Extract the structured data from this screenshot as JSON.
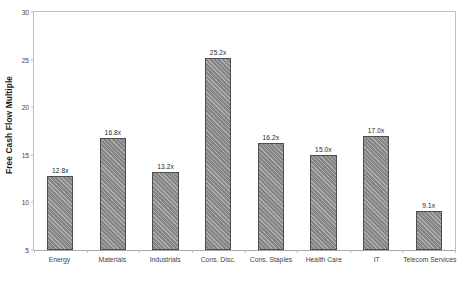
{
  "chart_data": {
    "type": "bar",
    "title": "",
    "xlabel": "",
    "ylabel": "Free Cash Flow Multiple",
    "ylim": [
      5,
      30
    ],
    "yticks": [
      5,
      10,
      15,
      20,
      25,
      30
    ],
    "ytick_labels": [
      "5",
      "10",
      "15",
      "20",
      "25",
      "30"
    ],
    "grid": false,
    "legend": false,
    "label_suffix": "x",
    "categories": [
      "Energy",
      "Materials",
      "Industrials",
      "Cons. Disc.",
      "Cons. Staples",
      "Health Care",
      "IT",
      "Telecom Services"
    ],
    "values": [
      12.8,
      16.8,
      13.2,
      25.2,
      16.2,
      15.0,
      17.0,
      9.1
    ],
    "data_labels": [
      "12.8x",
      "16.8x",
      "13.2x",
      "25.2x",
      "16.2x",
      "15.0x",
      "17.0x",
      "9.1x"
    ],
    "bar_color": "#858585",
    "bar_edge_color": "#4d4d4d",
    "bar_pattern": "diagonal-hatch",
    "frame_color": "#bfbfbf",
    "background_color": "#ffffff"
  },
  "caption": {
    "text": ""
  }
}
